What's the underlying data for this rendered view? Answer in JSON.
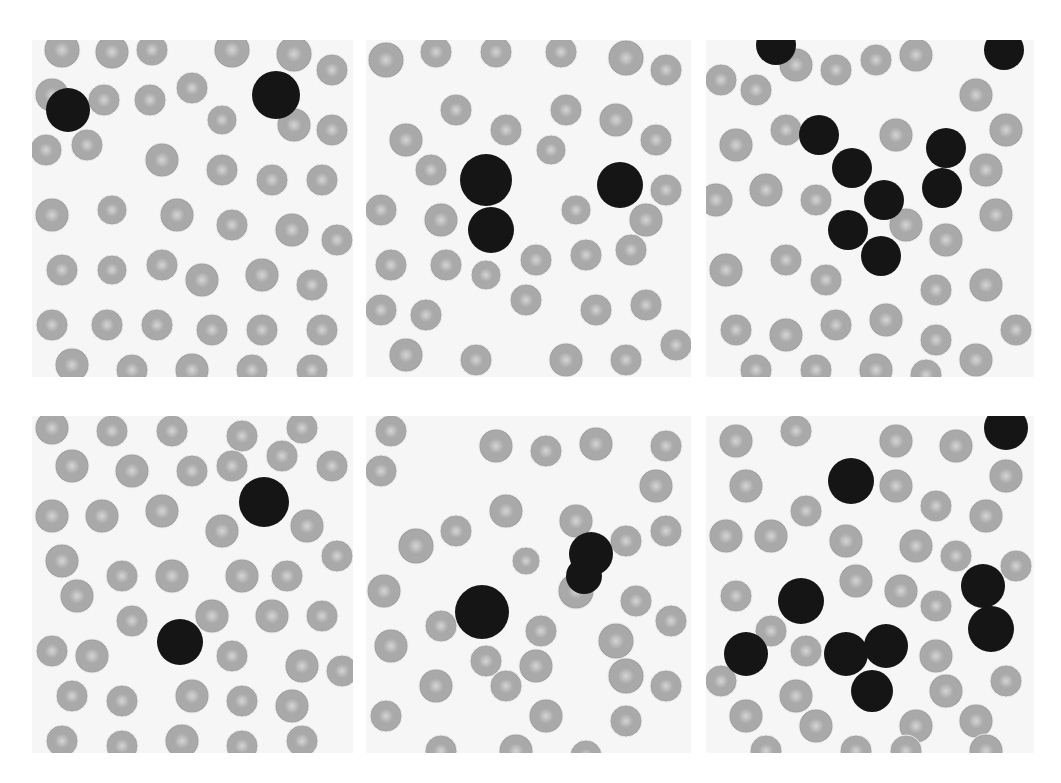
{
  "figure": {
    "background": "#ffffff",
    "colors": {
      "slide": "#f6f6f6",
      "rbc_fill": "#a9a9a9",
      "rbc_center": "#d4d4d4",
      "rbc_edge": "#8e8e8e",
      "wbc_fill": "#151515"
    },
    "panels": [
      {
        "id": "r1c1",
        "x": 32,
        "y": 40,
        "w": 321,
        "h": 337,
        "wbc": [
          [
            36,
            70,
            22
          ],
          [
            244,
            55,
            24
          ]
        ],
        "rbc": [
          [
            30,
            10,
            18
          ],
          [
            80,
            12,
            17
          ],
          [
            120,
            10,
            16
          ],
          [
            200,
            10,
            18
          ],
          [
            262,
            14,
            18
          ],
          [
            300,
            30,
            16
          ],
          [
            20,
            55,
            17
          ],
          [
            72,
            60,
            16
          ],
          [
            118,
            60,
            16
          ],
          [
            160,
            48,
            16
          ],
          [
            190,
            80,
            15
          ],
          [
            262,
            85,
            17
          ],
          [
            300,
            90,
            16
          ],
          [
            14,
            110,
            16
          ],
          [
            55,
            105,
            16
          ],
          [
            130,
            120,
            17
          ],
          [
            190,
            130,
            16
          ],
          [
            240,
            140,
            16
          ],
          [
            290,
            140,
            16
          ],
          [
            20,
            175,
            17
          ],
          [
            80,
            170,
            15
          ],
          [
            145,
            175,
            17
          ],
          [
            200,
            185,
            16
          ],
          [
            260,
            190,
            17
          ],
          [
            305,
            200,
            16
          ],
          [
            30,
            230,
            16
          ],
          [
            80,
            230,
            15
          ],
          [
            130,
            225,
            16
          ],
          [
            170,
            240,
            17
          ],
          [
            230,
            235,
            17
          ],
          [
            280,
            245,
            16
          ],
          [
            20,
            285,
            16
          ],
          [
            75,
            285,
            16
          ],
          [
            125,
            285,
            16
          ],
          [
            180,
            290,
            16
          ],
          [
            230,
            290,
            16
          ],
          [
            290,
            290,
            16
          ],
          [
            40,
            325,
            17
          ],
          [
            100,
            330,
            16
          ],
          [
            160,
            330,
            17
          ],
          [
            220,
            330,
            16
          ],
          [
            280,
            330,
            16
          ]
        ]
      },
      {
        "id": "r1c2",
        "x": 366,
        "y": 40,
        "w": 325,
        "h": 337,
        "wbc": [
          [
            120,
            140,
            26
          ],
          [
            125,
            190,
            23
          ],
          [
            254,
            145,
            23
          ]
        ],
        "rbc": [
          [
            20,
            20,
            18
          ],
          [
            70,
            12,
            16
          ],
          [
            130,
            12,
            16
          ],
          [
            195,
            12,
            16
          ],
          [
            260,
            18,
            18
          ],
          [
            300,
            30,
            16
          ],
          [
            90,
            70,
            16
          ],
          [
            200,
            70,
            16
          ],
          [
            250,
            80,
            17
          ],
          [
            40,
            100,
            17
          ],
          [
            140,
            90,
            16
          ],
          [
            185,
            110,
            15
          ],
          [
            290,
            100,
            16
          ],
          [
            65,
            130,
            16
          ],
          [
            300,
            150,
            16
          ],
          [
            15,
            170,
            16
          ],
          [
            75,
            180,
            17
          ],
          [
            210,
            170,
            15
          ],
          [
            280,
            180,
            17
          ],
          [
            25,
            225,
            16
          ],
          [
            80,
            225,
            16
          ],
          [
            170,
            220,
            16
          ],
          [
            220,
            215,
            16
          ],
          [
            265,
            210,
            16
          ],
          [
            120,
            235,
            15
          ],
          [
            15,
            270,
            16
          ],
          [
            60,
            275,
            16
          ],
          [
            160,
            260,
            16
          ],
          [
            230,
            270,
            16
          ],
          [
            280,
            265,
            16
          ],
          [
            40,
            315,
            17
          ],
          [
            110,
            320,
            16
          ],
          [
            200,
            320,
            17
          ],
          [
            260,
            320,
            16
          ],
          [
            310,
            305,
            16
          ]
        ]
      },
      {
        "id": "r1c3",
        "x": 706,
        "y": 40,
        "w": 328,
        "h": 337,
        "wbc": [
          [
            70,
            5,
            20
          ],
          [
            298,
            10,
            20
          ],
          [
            113,
            95,
            20
          ],
          [
            146,
            128,
            20
          ],
          [
            178,
            160,
            20
          ],
          [
            142,
            190,
            20
          ],
          [
            240,
            108,
            20
          ],
          [
            236,
            148,
            20
          ],
          [
            175,
            216,
            20
          ]
        ],
        "rbc": [
          [
            15,
            40,
            16
          ],
          [
            50,
            50,
            16
          ],
          [
            90,
            25,
            17
          ],
          [
            130,
            30,
            16
          ],
          [
            170,
            20,
            16
          ],
          [
            210,
            15,
            17
          ],
          [
            270,
            55,
            17
          ],
          [
            300,
            90,
            17
          ],
          [
            30,
            105,
            17
          ],
          [
            80,
            90,
            16
          ],
          [
            190,
            95,
            17
          ],
          [
            280,
            130,
            17
          ],
          [
            10,
            160,
            17
          ],
          [
            60,
            150,
            17
          ],
          [
            110,
            160,
            16
          ],
          [
            200,
            185,
            17
          ],
          [
            240,
            200,
            17
          ],
          [
            290,
            175,
            17
          ],
          [
            20,
            230,
            17
          ],
          [
            80,
            220,
            16
          ],
          [
            120,
            240,
            16
          ],
          [
            230,
            250,
            16
          ],
          [
            280,
            245,
            17
          ],
          [
            310,
            290,
            16
          ],
          [
            30,
            290,
            16
          ],
          [
            80,
            295,
            17
          ],
          [
            130,
            285,
            16
          ],
          [
            180,
            280,
            17
          ],
          [
            230,
            300,
            16
          ],
          [
            270,
            320,
            17
          ],
          [
            50,
            330,
            16
          ],
          [
            110,
            330,
            16
          ],
          [
            170,
            330,
            17
          ],
          [
            220,
            335,
            16
          ]
        ]
      },
      {
        "id": "r2c1",
        "x": 32,
        "y": 416,
        "w": 321,
        "h": 337,
        "wbc": [
          [
            232,
            86,
            25
          ],
          [
            148,
            226,
            23
          ]
        ],
        "rbc": [
          [
            20,
            12,
            17
          ],
          [
            80,
            15,
            16
          ],
          [
            140,
            15,
            16
          ],
          [
            210,
            20,
            16
          ],
          [
            270,
            12,
            16
          ],
          [
            40,
            50,
            17
          ],
          [
            100,
            55,
            17
          ],
          [
            160,
            55,
            16
          ],
          [
            200,
            50,
            16
          ],
          [
            250,
            40,
            16
          ],
          [
            300,
            50,
            16
          ],
          [
            20,
            100,
            17
          ],
          [
            70,
            100,
            17
          ],
          [
            130,
            95,
            17
          ],
          [
            190,
            115,
            17
          ],
          [
            275,
            110,
            17
          ],
          [
            305,
            140,
            16
          ],
          [
            30,
            145,
            17
          ],
          [
            90,
            160,
            16
          ],
          [
            140,
            160,
            17
          ],
          [
            210,
            160,
            17
          ],
          [
            255,
            160,
            16
          ],
          [
            45,
            180,
            17
          ],
          [
            100,
            205,
            16
          ],
          [
            180,
            200,
            17
          ],
          [
            240,
            200,
            17
          ],
          [
            290,
            200,
            16
          ],
          [
            20,
            235,
            16
          ],
          [
            60,
            240,
            17
          ],
          [
            200,
            240,
            16
          ],
          [
            270,
            250,
            17
          ],
          [
            310,
            255,
            16
          ],
          [
            40,
            280,
            16
          ],
          [
            90,
            285,
            16
          ],
          [
            160,
            280,
            17
          ],
          [
            210,
            285,
            16
          ],
          [
            260,
            290,
            17
          ],
          [
            30,
            325,
            16
          ],
          [
            90,
            330,
            16
          ],
          [
            150,
            325,
            17
          ],
          [
            210,
            330,
            16
          ],
          [
            270,
            325,
            16
          ]
        ]
      },
      {
        "id": "r2c2",
        "x": 366,
        "y": 416,
        "w": 325,
        "h": 337,
        "wbc": [
          [
            116,
            196,
            27
          ],
          [
            225,
            138,
            22
          ],
          [
            218,
            160,
            18
          ]
        ],
        "rbc": [
          [
            25,
            15,
            16
          ],
          [
            130,
            30,
            17
          ],
          [
            180,
            35,
            16
          ],
          [
            230,
            28,
            17
          ],
          [
            300,
            30,
            16
          ],
          [
            15,
            55,
            16
          ],
          [
            290,
            70,
            17
          ],
          [
            140,
            95,
            17
          ],
          [
            210,
            105,
            17
          ],
          [
            90,
            115,
            16
          ],
          [
            260,
            125,
            16
          ],
          [
            300,
            115,
            16
          ],
          [
            50,
            130,
            18
          ],
          [
            160,
            145,
            14
          ],
          [
            18,
            175,
            17
          ],
          [
            210,
            175,
            18
          ],
          [
            270,
            185,
            16
          ],
          [
            305,
            205,
            16
          ],
          [
            75,
            210,
            16
          ],
          [
            175,
            215,
            16
          ],
          [
            250,
            225,
            18
          ],
          [
            25,
            230,
            17
          ],
          [
            120,
            245,
            16
          ],
          [
            170,
            250,
            17
          ],
          [
            70,
            270,
            17
          ],
          [
            140,
            270,
            16
          ],
          [
            260,
            260,
            18
          ],
          [
            300,
            270,
            16
          ],
          [
            20,
            300,
            16
          ],
          [
            180,
            300,
            17
          ],
          [
            260,
            305,
            16
          ],
          [
            75,
            335,
            16
          ],
          [
            150,
            335,
            17
          ],
          [
            220,
            340,
            16
          ]
        ]
      },
      {
        "id": "r2c3",
        "x": 706,
        "y": 416,
        "w": 328,
        "h": 337,
        "wbc": [
          [
            145,
            65,
            23
          ],
          [
            95,
            185,
            23
          ],
          [
            40,
            238,
            22
          ],
          [
            300,
            12,
            22
          ],
          [
            277,
            170,
            22
          ],
          [
            285,
            213,
            23
          ],
          [
            140,
            238,
            22
          ],
          [
            180,
            230,
            22
          ],
          [
            166,
            275,
            21
          ]
        ],
        "rbc": [
          [
            30,
            25,
            17
          ],
          [
            90,
            15,
            16
          ],
          [
            190,
            25,
            17
          ],
          [
            250,
            30,
            17
          ],
          [
            300,
            60,
            17
          ],
          [
            40,
            70,
            17
          ],
          [
            100,
            95,
            16
          ],
          [
            190,
            70,
            17
          ],
          [
            230,
            90,
            16
          ],
          [
            280,
            100,
            17
          ],
          [
            20,
            120,
            17
          ],
          [
            65,
            120,
            17
          ],
          [
            140,
            125,
            17
          ],
          [
            210,
            130,
            17
          ],
          [
            250,
            140,
            16
          ],
          [
            310,
            150,
            16
          ],
          [
            30,
            180,
            16
          ],
          [
            150,
            165,
            17
          ],
          [
            195,
            175,
            17
          ],
          [
            230,
            190,
            16
          ],
          [
            65,
            215,
            16
          ],
          [
            100,
            235,
            16
          ],
          [
            230,
            240,
            17
          ],
          [
            15,
            265,
            16
          ],
          [
            90,
            280,
            17
          ],
          [
            240,
            275,
            17
          ],
          [
            300,
            265,
            16
          ],
          [
            40,
            300,
            17
          ],
          [
            110,
            310,
            17
          ],
          [
            210,
            310,
            17
          ],
          [
            270,
            305,
            17
          ],
          [
            60,
            335,
            16
          ],
          [
            150,
            335,
            16
          ],
          [
            200,
            335,
            16
          ],
          [
            280,
            335,
            17
          ]
        ]
      }
    ]
  }
}
